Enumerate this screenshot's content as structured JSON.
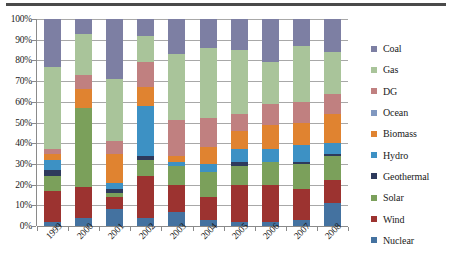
{
  "chart_data": {
    "type": "bar",
    "stacked": true,
    "normalized_percent": true,
    "title": "",
    "subtitle": "",
    "xlabel": "",
    "ylabel": "",
    "ylim": [
      0,
      100
    ],
    "ytick_labels": [
      "0%",
      "10%",
      "20%",
      "30%",
      "40%",
      "50%",
      "60%",
      "70%",
      "80%",
      "90%",
      "100%"
    ],
    "ytick_values": [
      0,
      10,
      20,
      30,
      40,
      50,
      60,
      70,
      80,
      90,
      100
    ],
    "grid": true,
    "legend_position": "right",
    "categories": [
      "1999",
      "2000",
      "2001",
      "2002",
      "2003",
      "2004",
      "2005",
      "2006",
      "2007",
      "2008"
    ],
    "series": [
      {
        "name": "Nuclear",
        "color": "#4472a0",
        "values": [
          2,
          4,
          8,
          4,
          7,
          3,
          2,
          2,
          3,
          11
        ]
      },
      {
        "name": "Wind",
        "color": "#9c3330",
        "values": [
          15,
          15,
          6,
          20,
          13,
          11,
          18,
          18,
          15,
          11
        ]
      },
      {
        "name": "Solar",
        "color": "#7ba05b",
        "values": [
          7,
          38,
          2,
          8,
          9,
          12,
          9,
          11,
          12,
          12
        ]
      },
      {
        "name": "Geothermal",
        "color": "#2e3a5c",
        "values": [
          3,
          0,
          2,
          2,
          0,
          0,
          2,
          0,
          1,
          1
        ]
      },
      {
        "name": "Hydro",
        "color": "#3d91c4",
        "values": [
          5,
          0,
          3,
          24,
          2,
          4,
          6,
          6,
          8,
          5
        ]
      },
      {
        "name": "Biomass",
        "color": "#e08330",
        "values": [
          3,
          9,
          14,
          9,
          3,
          8,
          9,
          12,
          11,
          14
        ]
      },
      {
        "name": "DG",
        "color": "#c08080",
        "values": [
          2,
          7,
          6,
          12,
          17,
          14,
          8,
          10,
          10,
          10
        ]
      },
      {
        "name": "Ocean",
        "color": "#8098c0",
        "values": [
          0,
          0,
          0,
          0,
          0,
          0,
          0,
          0,
          0,
          0
        ]
      },
      {
        "name": "Gas",
        "color": "#a9c49a",
        "values": [
          40,
          20,
          30,
          13,
          32,
          34,
          31,
          20,
          27,
          20
        ]
      },
      {
        "name": "Coal",
        "color": "#7d7fa3",
        "values": [
          23,
          7,
          29,
          8,
          17,
          14,
          15,
          21,
          13,
          16
        ]
      }
    ],
    "legend_order_top_to_bottom": [
      "Coal",
      "Gas",
      "DG",
      "Ocean",
      "Biomass",
      "Hydro",
      "Geothermal",
      "Solar",
      "Wind",
      "Nuclear"
    ]
  }
}
